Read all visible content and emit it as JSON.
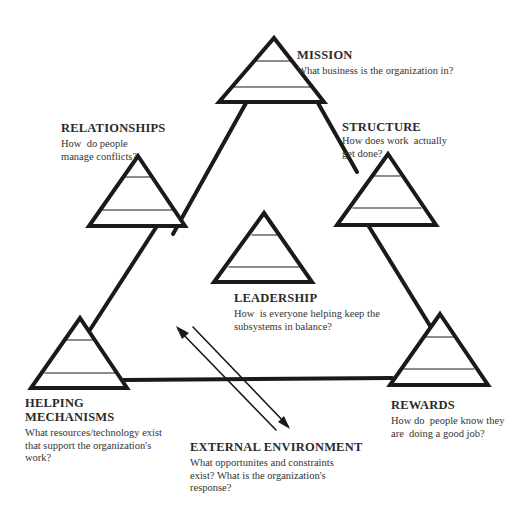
{
  "diagram": {
    "type": "organizational-model",
    "colors": {
      "line": "#1a1a1a",
      "text": "#2b2b2b",
      "background": "#ffffff"
    }
  },
  "nodes": {
    "mission": {
      "title": "MISSION",
      "desc": [
        "What business is the organization in?"
      ]
    },
    "relationships": {
      "title": "RELATIONSHIPS",
      "desc": [
        "How  do people",
        "manage conflicts?"
      ]
    },
    "structure": {
      "title": "STRUCTURE",
      "desc": [
        "How does work  actually",
        "get done?"
      ]
    },
    "leadership": {
      "title": "LEADERSHIP",
      "desc": [
        "How  is everyone helping keep the",
        "subsystems in balance?"
      ]
    },
    "helping": {
      "title": [
        "HELPING",
        "MECHANISMS"
      ],
      "desc": [
        "What resources/technology exist",
        "that support the organization's",
        "work?"
      ]
    },
    "rewards": {
      "title": "REWARDS",
      "desc": [
        "How do  people know they",
        "are  doing a good job?"
      ]
    },
    "external": {
      "title": "EXTERNAL ENVIRONMENT",
      "desc": [
        "What opportunites and constraints",
        "exist? What is the organization's",
        "response?"
      ]
    }
  }
}
